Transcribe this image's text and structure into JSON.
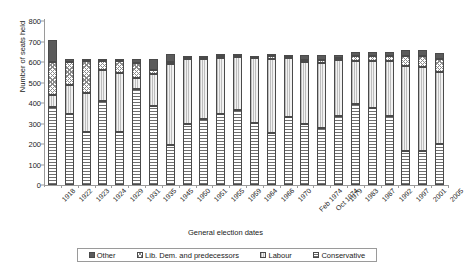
{
  "chart_data": {
    "type": "bar",
    "title": "",
    "subtitle": "",
    "xlabel": "General election dates",
    "ylabel": "Number of seats held",
    "stacked": true,
    "grid": false,
    "legend_position": "bottom",
    "ylim": [
      0,
      800
    ],
    "yticks": [
      0,
      100,
      200,
      300,
      400,
      500,
      600,
      700,
      800
    ],
    "categories": [
      "1918",
      "1922",
      "1923",
      "1924",
      "1929",
      "1931",
      "1935",
      "1945",
      "1950",
      "1951",
      "1955",
      "1959",
      "1964",
      "1966",
      "1970",
      "Feb 1974",
      "Oct 1974",
      "1979",
      "1983",
      "1987",
      "1992",
      "1997",
      "2001",
      "2005"
    ],
    "series": [
      {
        "name": "Conservative",
        "color": "#6f6f6f",
        "pattern": "horizontal-hatch",
        "values": [
          382,
          344,
          258,
          412,
          260,
          470,
          387,
          197,
          298,
          321,
          345,
          365,
          304,
          253,
          330,
          297,
          277,
          339,
          397,
          376,
          336,
          165,
          166,
          198
        ]
      },
      {
        "name": "Labour",
        "color": "#f2f2f2",
        "pattern": "vertical-hatch",
        "values": [
          57,
          142,
          191,
          151,
          287,
          52,
          154,
          393,
          315,
          295,
          277,
          258,
          317,
          364,
          288,
          301,
          319,
          269,
          209,
          229,
          271,
          418,
          412,
          355
        ]
      },
      {
        "name": "Lib. Dem. and predecessors",
        "color": "#ffffff",
        "pattern": "checker",
        "values": [
          163,
          115,
          158,
          40,
          59,
          72,
          21,
          12,
          9,
          6,
          6,
          6,
          9,
          12,
          6,
          14,
          13,
          11,
          23,
          22,
          20,
          46,
          52,
          62
        ]
      },
      {
        "name": "Other",
        "color": "#5b5b5b",
        "pattern": "solid",
        "values": [
          105,
          16,
          8,
          12,
          9,
          21,
          53,
          38,
          3,
          3,
          2,
          1,
          0,
          1,
          6,
          23,
          26,
          16,
          21,
          23,
          24,
          30,
          29,
          31
        ]
      }
    ]
  },
  "legend": {
    "items": [
      {
        "label": "Other",
        "key": "other"
      },
      {
        "label": "Lib. Dem. and predecessors",
        "key": "libdem"
      },
      {
        "label": "Labour",
        "key": "labour"
      },
      {
        "label": "Conservative",
        "key": "conservative"
      }
    ]
  }
}
